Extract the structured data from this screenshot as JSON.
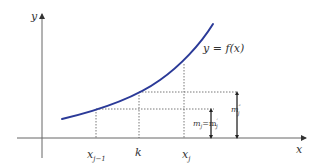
{
  "diagram": {
    "axes": {
      "x_label": "x",
      "y_label": "y"
    },
    "curve": {
      "label": "y = f(x)",
      "color": "#2b3a98"
    },
    "ticks": {
      "x_j_minus_1": {
        "base": "x",
        "sub": "j−1"
      },
      "k": "k",
      "x_j": {
        "base": "x",
        "sub": "j"
      }
    },
    "annotations": {
      "lower_height": {
        "text": "m",
        "sub": "j",
        "eq": "=m",
        "sup": "′",
        "sub2": "j"
      },
      "upper_height": {
        "text": "m",
        "sup": "″",
        "sub": "j"
      }
    },
    "colors": {
      "axis": "#555555",
      "dashed": "#555555",
      "text": "#333333"
    }
  }
}
